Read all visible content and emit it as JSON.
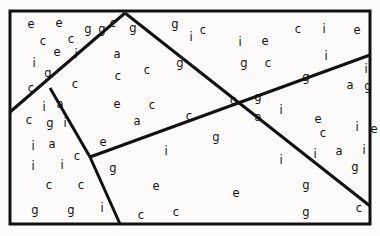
{
  "figure": {
    "width": 380,
    "height": 236,
    "background_color": "#fdfcfa",
    "ink_color": "#111111",
    "letter_font_size": 11.5
  },
  "frame": {
    "name": "outer-rectangle",
    "x": 10,
    "y": 11,
    "width": 360,
    "height": 213,
    "stroke_width": 3,
    "stroke_color": "#111111"
  },
  "partition_lines": [
    {
      "name": "left-peak-line",
      "description": "rises from left border up-right to the top apex",
      "x1": 10,
      "y1": 112,
      "x2": 125,
      "y2": 13,
      "stroke_width": 3
    },
    {
      "name": "right-descent-from-apex",
      "description": "falls from the top apex down-right through the central crossing to the right border",
      "x1": 125,
      "y1": 13,
      "x2": 370,
      "y2": 206,
      "stroke_width": 3
    },
    {
      "name": "low-rising-diagonal",
      "description": "rises from the left junction across the middle to the right border",
      "x1": 90,
      "y1": 157,
      "x2": 370,
      "y2": 55,
      "stroke_width": 3
    },
    {
      "name": "short-vertex-stub",
      "description": "short segment from the left-peak line down to the junction",
      "x1": 50,
      "y1": 88,
      "x2": 90,
      "y2": 157,
      "stroke_width": 3
    },
    {
      "name": "junction-to-bottom-line",
      "description": "falls from the junction down-right to the bottom border",
      "x1": 90,
      "y1": 157,
      "x2": 120,
      "y2": 224,
      "stroke_width": 3
    }
  ],
  "letters": [
    {
      "char": "e",
      "x": 31,
      "y": 25
    },
    {
      "char": "e",
      "x": 59,
      "y": 24
    },
    {
      "char": "g",
      "x": 88,
      "y": 30
    },
    {
      "char": "g",
      "x": 102,
      "y": 30
    },
    {
      "char": "c",
      "x": 113,
      "y": 24
    },
    {
      "char": "g",
      "x": 133,
      "y": 29
    },
    {
      "char": "g",
      "x": 175,
      "y": 25
    },
    {
      "char": "c",
      "x": 203,
      "y": 31
    },
    {
      "char": "c",
      "x": 298,
      "y": 30
    },
    {
      "char": "i",
      "x": 324,
      "y": 30
    },
    {
      "char": "e",
      "x": 357,
      "y": 31
    },
    {
      "char": "c",
      "x": 43,
      "y": 42
    },
    {
      "char": "c",
      "x": 71,
      "y": 40
    },
    {
      "char": "i",
      "x": 191,
      "y": 38
    },
    {
      "char": "i",
      "x": 240,
      "y": 43
    },
    {
      "char": "e",
      "x": 265,
      "y": 42
    },
    {
      "char": "e",
      "x": 57,
      "y": 53
    },
    {
      "char": "i",
      "x": 76,
      "y": 55
    },
    {
      "char": "a",
      "x": 117,
      "y": 55
    },
    {
      "char": "i",
      "x": 326,
      "y": 57
    },
    {
      "char": "i",
      "x": 34,
      "y": 64
    },
    {
      "char": "g",
      "x": 180,
      "y": 64
    },
    {
      "char": "g",
      "x": 244,
      "y": 64
    },
    {
      "char": "c",
      "x": 268,
      "y": 64
    },
    {
      "char": "g",
      "x": 48,
      "y": 74
    },
    {
      "char": "c",
      "x": 147,
      "y": 71
    },
    {
      "char": "i",
      "x": 366,
      "y": 70
    },
    {
      "char": "c",
      "x": 118,
      "y": 77
    },
    {
      "char": "g",
      "x": 306,
      "y": 78
    },
    {
      "char": "c",
      "x": 31,
      "y": 89
    },
    {
      "char": "c",
      "x": 75,
      "y": 85
    },
    {
      "char": "a",
      "x": 350,
      "y": 86
    },
    {
      "char": "g",
      "x": 368,
      "y": 87
    },
    {
      "char": "i",
      "x": 44,
      "y": 108
    },
    {
      "char": "a",
      "x": 60,
      "y": 105
    },
    {
      "char": "e",
      "x": 117,
      "y": 105
    },
    {
      "char": "c",
      "x": 152,
      "y": 106
    },
    {
      "char": "c",
      "x": 233,
      "y": 101
    },
    {
      "char": "g",
      "x": 258,
      "y": 98
    },
    {
      "char": "c",
      "x": 29,
      "y": 121
    },
    {
      "char": "g",
      "x": 50,
      "y": 124
    },
    {
      "char": "i",
      "x": 65,
      "y": 124
    },
    {
      "char": "a",
      "x": 137,
      "y": 122
    },
    {
      "char": "c",
      "x": 189,
      "y": 117
    },
    {
      "char": "a",
      "x": 258,
      "y": 118
    },
    {
      "char": "i",
      "x": 281,
      "y": 111
    },
    {
      "char": "e",
      "x": 318,
      "y": 120
    },
    {
      "char": "c",
      "x": 323,
      "y": 134
    },
    {
      "char": "i",
      "x": 357,
      "y": 128
    },
    {
      "char": "e",
      "x": 374,
      "y": 130
    },
    {
      "char": "i",
      "x": 33,
      "y": 147
    },
    {
      "char": "a",
      "x": 52,
      "y": 145
    },
    {
      "char": "e",
      "x": 103,
      "y": 143
    },
    {
      "char": "g",
      "x": 216,
      "y": 138
    },
    {
      "char": "i",
      "x": 166,
      "y": 152
    },
    {
      "char": "c",
      "x": 77,
      "y": 157
    },
    {
      "char": "i",
      "x": 315,
      "y": 155
    },
    {
      "char": "a",
      "x": 339,
      "y": 152
    },
    {
      "char": "i",
      "x": 364,
      "y": 151
    },
    {
      "char": "i",
      "x": 33,
      "y": 167
    },
    {
      "char": "i",
      "x": 62,
      "y": 166
    },
    {
      "char": "g",
      "x": 113,
      "y": 169
    },
    {
      "char": "i",
      "x": 281,
      "y": 161
    },
    {
      "char": "g",
      "x": 355,
      "y": 168
    },
    {
      "char": "c",
      "x": 49,
      "y": 186
    },
    {
      "char": "c",
      "x": 81,
      "y": 186
    },
    {
      "char": "e",
      "x": 156,
      "y": 187
    },
    {
      "char": "e",
      "x": 236,
      "y": 194
    },
    {
      "char": "g",
      "x": 306,
      "y": 186
    },
    {
      "char": "g",
      "x": 35,
      "y": 211
    },
    {
      "char": "g",
      "x": 71,
      "y": 211
    },
    {
      "char": "i",
      "x": 102,
      "y": 209
    },
    {
      "char": "c",
      "x": 141,
      "y": 216
    },
    {
      "char": "c",
      "x": 176,
      "y": 213
    },
    {
      "char": "g",
      "x": 306,
      "y": 213
    },
    {
      "char": "c",
      "x": 359,
      "y": 209
    }
  ]
}
